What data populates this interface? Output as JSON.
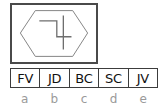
{
  "figure": {
    "panel_name": "glyph-panel",
    "shape": "hexagon",
    "glyph_description": "four-like-glyph",
    "border_color": "#4a4a4a",
    "outline_color": "#808080",
    "background": "#ffffff"
  },
  "code_boxes": [
    {
      "label": "FV"
    },
    {
      "label": "JD"
    },
    {
      "label": "BC"
    },
    {
      "label": "SC"
    },
    {
      "label": "JV"
    }
  ],
  "captions": [
    {
      "label": "a"
    },
    {
      "label": "b"
    },
    {
      "label": "c"
    },
    {
      "label": "d"
    },
    {
      "label": "e"
    }
  ],
  "colors": {
    "code_text": "#111111",
    "caption_text": "#9a9a9a",
    "cell_border": "#3c3c3c"
  }
}
